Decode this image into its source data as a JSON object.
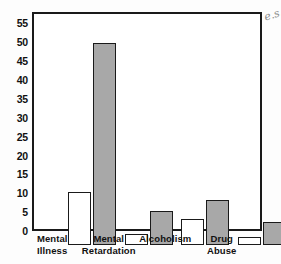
{
  "chart_data": {
    "type": "bar",
    "title": "",
    "xlabel": "",
    "ylabel": "",
    "ylim": [
      0,
      57.5
    ],
    "grid": false,
    "legend_position": "none",
    "categories": [
      "Mental Illness",
      "Mental Retardation",
      "Alcoholism",
      "Drug Abuse"
    ],
    "category_lines": [
      [
        "Mental",
        "Illness"
      ],
      [
        "Mental",
        "Retardation"
      ],
      [
        "Alcoholism",
        ""
      ],
      [
        "Drug",
        "Abuse"
      ]
    ],
    "yticks": [
      0,
      5,
      10,
      15,
      20,
      25,
      30,
      35,
      40,
      45,
      50,
      55
    ],
    "ytick_labels": [
      "0",
      "5",
      "10",
      "15",
      "20",
      "25",
      "30",
      "35",
      "40",
      "45",
      "50",
      "55"
    ],
    "series": [
      {
        "name": "open-bar",
        "style": "white",
        "color": "#ffffff",
        "values": [
          14,
          3,
          7,
          2
        ]
      },
      {
        "name": "filled-bar",
        "style": "gray",
        "color": "#a8a8a8",
        "values": [
          53.5,
          9,
          12,
          6
        ]
      }
    ]
  },
  "annotations": {
    "scan_mark": "e.s."
  },
  "colors": {
    "axis": "#1a1a1a",
    "bar_open": "#ffffff",
    "bar_fill": "#a8a8a8",
    "text": "#111111"
  }
}
